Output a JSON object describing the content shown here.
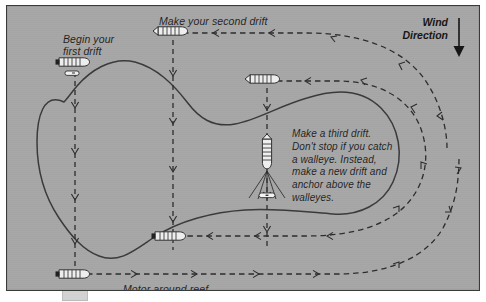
{
  "figure": {
    "background_color": "#a6a6a6",
    "ink_color": "#2b2b2b",
    "border_color": "#3a3a3a"
  },
  "labels": {
    "first_drift": "Begin your\nfirst drift",
    "second_drift": "Make your second drift",
    "third_drift": "Make a third drift.\nDon't stop if you catch\na walleye. Instead,\nmake a new drift and\nanchor above the\nwalleyes.",
    "motor_around_reef": "Motor around reef",
    "wind_direction": "Wind\nDirection"
  },
  "icons": {
    "wind_arrow": "down-arrow-icon",
    "boat": "boat-icon",
    "anchored_boat": "anchored-boat-icon"
  },
  "markers": [
    {
      "name": "boat-first-drift",
      "x": 68,
      "y": 62,
      "heading": "left"
    },
    {
      "name": "boat-second-drift",
      "x": 166,
      "y": 30,
      "heading": "left"
    },
    {
      "name": "boat-third-drift",
      "x": 260,
      "y": 78,
      "heading": "left"
    },
    {
      "name": "boat-anchored-mid-reef",
      "x": 262,
      "y": 152,
      "heading": "down"
    },
    {
      "name": "boat-fourth-drift",
      "x": 167,
      "y": 246,
      "heading": "left"
    },
    {
      "name": "boat-motor-around-reef",
      "x": 70,
      "y": 274,
      "heading": "left"
    }
  ],
  "drift_paths": [
    {
      "name": "drift-path-1",
      "direction": "south"
    },
    {
      "name": "drift-path-2",
      "direction": "south"
    },
    {
      "name": "drift-path-3",
      "direction": "south"
    },
    {
      "name": "return-path-upper",
      "direction": "west"
    },
    {
      "name": "return-path-middle",
      "direction": "west"
    },
    {
      "name": "return-path-lower",
      "direction": "west"
    }
  ]
}
